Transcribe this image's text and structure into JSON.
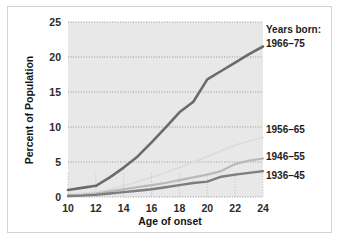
{
  "chart_data": {
    "type": "line",
    "title": "",
    "xlabel": "Age of onset",
    "ylabel": "Percent of Population",
    "xlim": [
      10,
      24
    ],
    "ylim": [
      0,
      25
    ],
    "xticks": [
      10,
      12,
      14,
      16,
      18,
      20,
      22,
      24
    ],
    "yticks": [
      0,
      5,
      10,
      15,
      20,
      25
    ],
    "xtick_labels": [
      "10",
      "12",
      "14",
      "16",
      "18",
      "20",
      "22",
      "24"
    ],
    "ytick_labels": [
      "0",
      "5",
      "10",
      "15",
      "20",
      "25"
    ],
    "grid": "horizontal-dotted",
    "legend_position": "right-of-lines",
    "legend_title": "Years born:",
    "x": [
      10,
      11,
      12,
      13,
      14,
      15,
      16,
      17,
      18,
      19,
      20,
      21,
      22,
      23,
      24
    ],
    "series": [
      {
        "name": "1966–75",
        "color": "#6b6b6b",
        "width": 2.6,
        "values": [
          1.0,
          1.3,
          1.6,
          2.8,
          4.2,
          5.8,
          7.8,
          9.9,
          12.1,
          13.6,
          16.8,
          18.0,
          19.2,
          20.4,
          21.5
        ]
      },
      {
        "name": "1956–65",
        "color": "#dcdcdc",
        "width": 1.8,
        "values": [
          0.4,
          0.5,
          0.7,
          1.1,
          1.6,
          2.2,
          2.8,
          3.5,
          4.2,
          5.0,
          5.8,
          6.6,
          7.4,
          8.0,
          8.5
        ]
      },
      {
        "name": "1946–55",
        "color": "#b9b9b9",
        "width": 2.2,
        "values": [
          0.2,
          0.3,
          0.5,
          0.8,
          1.1,
          1.4,
          1.7,
          2.0,
          2.4,
          2.8,
          3.2,
          3.7,
          4.7,
          5.2,
          5.5
        ]
      },
      {
        "name": "1936–45",
        "color": "#7d7d7d",
        "width": 2.4,
        "values": [
          0.15,
          0.2,
          0.3,
          0.5,
          0.7,
          0.9,
          1.1,
          1.4,
          1.7,
          2.0,
          2.2,
          2.9,
          3.2,
          3.45,
          3.7
        ]
      }
    ],
    "annotations": [
      {
        "text": "Years born:",
        "series": null
      },
      {
        "text": "1966–75",
        "series": "1966–75"
      },
      {
        "text": "1956–65",
        "series": "1956–65"
      },
      {
        "text": "1946–55",
        "series": "1946–55"
      },
      {
        "text": "1936–45",
        "series": "1936–45"
      }
    ]
  },
  "axes": {
    "x_title": "Age of onset",
    "y_title": "Percent of Population"
  },
  "colors": {
    "plot_background": "#e8e8e8",
    "figure_background": "#ffffff",
    "frame_border": "#d2d2d2",
    "gridline": "#8c8c8c",
    "text": "#1d1d1d"
  }
}
